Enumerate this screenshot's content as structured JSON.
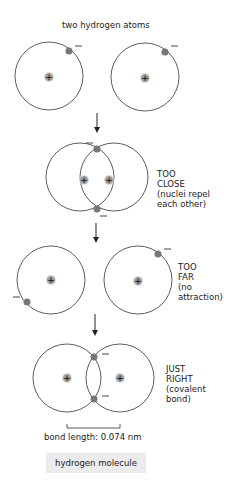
{
  "title": "two hydrogen atoms",
  "stages": [
    {
      "id": "separate",
      "label_lines": []
    },
    {
      "id": "too-close",
      "label_lines": [
        "TOO",
        "CLOSE",
        "(nuclei repel",
        "each other)"
      ]
    },
    {
      "id": "too-far",
      "label_lines": [
        "TOO",
        "FAR",
        "(no",
        "attraction)"
      ]
    },
    {
      "id": "just-right",
      "label_lines": [
        "JUST",
        "RIGHT",
        "(covalent",
        "bond)"
      ]
    }
  ],
  "bond_length_label": "bond length: 0.074 nm",
  "caption": "hydrogen molecule",
  "symbols": {
    "nucleus": "+",
    "electron": "−"
  },
  "colors": {
    "line": "#333333",
    "electron": "#7a7a7a",
    "nucleus_glow": "#9a9a9a",
    "caption_bg": "#ececec"
  }
}
